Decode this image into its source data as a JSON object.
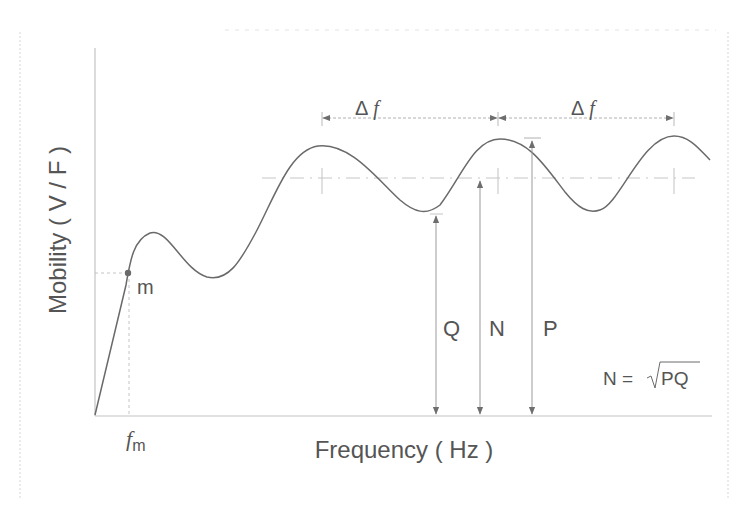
{
  "diagram": {
    "y_axis_label": "Mobility ( V / F )",
    "x_axis_label": "Frequency ( Hz )",
    "point_label": "m",
    "fm_label_main": "f",
    "fm_label_sub": "m",
    "delta_f_labels": [
      {
        "symbol": "Δ",
        "var": "f"
      },
      {
        "symbol": "Δ",
        "var": "f"
      }
    ],
    "arrow_labels": {
      "q": "Q",
      "n": "N",
      "p": "P"
    },
    "formula": {
      "lhs": "N =",
      "radicand": "PQ"
    },
    "colors": {
      "curve": "#6a6a6a",
      "axis": "#c8c8c8",
      "dashed": "#bdbdbd",
      "arrow": "#7a7a7a",
      "text": "#555555",
      "frame": "#cfcfcf"
    }
  }
}
